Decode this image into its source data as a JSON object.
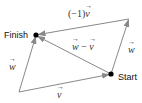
{
  "diagram": {
    "points": {
      "origin": {
        "x": 19,
        "y": 92
      },
      "start": {
        "x": 111,
        "y": 74,
        "label": "Start"
      },
      "top_right": {
        "x": 129,
        "y": 19
      },
      "finish": {
        "x": 36,
        "y": 35,
        "label": "Finish"
      }
    },
    "labels": {
      "neg_v_prefix": "(−1)",
      "neg_v_vec": "v",
      "diff_w": "w",
      "diff_minus": " − ",
      "diff_v": "v",
      "right_w": "w",
      "left_w": "w",
      "bottom_v": "v"
    },
    "colors": {
      "arrow": "#888888",
      "dot": "#000000",
      "text": "#222222"
    }
  }
}
